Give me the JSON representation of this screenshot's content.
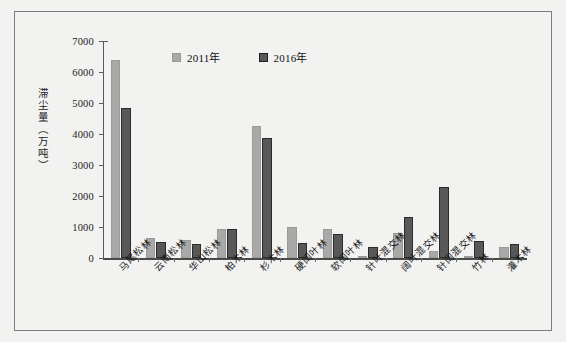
{
  "figure": {
    "background": "#f2f2f1",
    "border_color": "#7d7d7d"
  },
  "axis": {
    "y_title": "滞尘量（万吨）",
    "y_ticks": [
      "7000",
      "6000",
      "5000",
      "4000",
      "3000",
      "2000",
      "1000",
      "0"
    ]
  },
  "legend": {
    "items": [
      {
        "label": "2011年",
        "color": "#a9a9a7"
      },
      {
        "label": "2016年",
        "color": "#585858"
      }
    ]
  },
  "chart_data": {
    "type": "bar",
    "title": "",
    "xlabel": "",
    "ylabel": "滞尘量（万吨）",
    "ylim": [
      0,
      7000
    ],
    "ytick_step": 1000,
    "grid": false,
    "legend_position": "top-center",
    "categories": [
      "马尾松林",
      "云南松林",
      "华山松林",
      "柏木林",
      "杉木林",
      "硬阔叶林",
      "软阔叶林",
      "针叶混交林",
      "阔叶混交林",
      "针阔混交林",
      "竹林",
      "灌木林"
    ],
    "series": [
      {
        "name": "2011年",
        "color": "#a9a9a7",
        "values": [
          6380,
          650,
          570,
          930,
          4270,
          1000,
          940,
          60,
          800,
          230,
          20,
          350
        ]
      },
      {
        "name": "2016年",
        "color": "#585858",
        "values": [
          4840,
          510,
          450,
          950,
          3870,
          490,
          760,
          340,
          1320,
          2280,
          540,
          460
        ]
      }
    ]
  }
}
